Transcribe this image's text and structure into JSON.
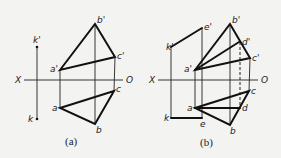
{
  "figure_a": {
    "caption": "(a)",
    "axis": {
      "left_label": "X",
      "right_label": "O"
    },
    "labels": {
      "k_prime": "k'",
      "k": "k",
      "a_prime": "a'",
      "b_prime": "b'",
      "c_prime": "c'",
      "a": "a",
      "b": "b",
      "c": "c"
    }
  },
  "figure_b": {
    "caption": "(b)",
    "axis": {
      "left_label": "X",
      "right_label": "O"
    },
    "labels": {
      "k_prime": "k'",
      "k": "k",
      "e_prime": "e'",
      "e": "e",
      "a_prime": "a'",
      "b_prime": "b'",
      "c_prime": "c'",
      "d_prime": "d'",
      "a": "a",
      "b": "b",
      "c": "c",
      "d": "d"
    }
  }
}
